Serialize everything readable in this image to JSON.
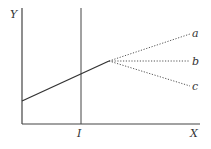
{
  "diagram": {
    "axes": {
      "y_label": "Y",
      "x_label": "X"
    },
    "marker": {
      "label": "I"
    },
    "branches": [
      {
        "label": "a",
        "direction": "rising"
      },
      {
        "label": "b",
        "direction": "flat"
      },
      {
        "label": "c",
        "direction": "falling"
      }
    ],
    "colors": {
      "line": "#333333",
      "dotted": "#555555",
      "background": "#ffffff"
    }
  }
}
